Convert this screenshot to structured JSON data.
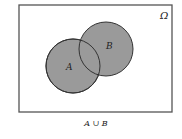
{
  "diagram": {
    "type": "venn",
    "universe": {
      "label": "Ω",
      "x": 19,
      "y": 5,
      "width": 153,
      "height": 107
    },
    "sets": [
      {
        "label": "A",
        "cx": 73,
        "cy": 66,
        "r": 27
      },
      {
        "label": "B",
        "cx": 106,
        "cy": 49,
        "r": 27
      }
    ],
    "shaded": "A ∪ B",
    "caption": "A ∪ B",
    "colors": {
      "fill": "#9a9a9a",
      "stroke": "#333333",
      "border": "#555555"
    }
  }
}
